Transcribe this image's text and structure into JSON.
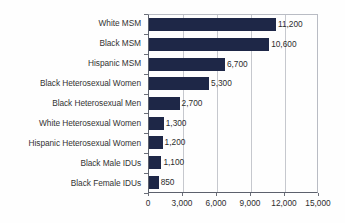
{
  "chart_data": {
    "type": "bar",
    "orientation": "horizontal",
    "title": "",
    "subtitle": "",
    "xlabel": "",
    "ylabel": "",
    "xlim": [
      0,
      15000
    ],
    "grid": true,
    "legend": false,
    "legend_position": "none",
    "bar_color": "#1e2747",
    "gridline_color": "#c6c8ce",
    "axis_color": "#5d616d",
    "background_color": "#fefefe",
    "categories": [
      "White MSM",
      "Black MSM",
      "Hispanic MSM",
      "Black Heterosexual Women",
      "Black Heterosexual Men",
      "White Heterosexual Women",
      "Hispanic Heterosexual Women",
      "Black Male IDUs",
      "Black Female IDUs"
    ],
    "values": [
      11200,
      10600,
      6700,
      5300,
      2700,
      1300,
      1200,
      1100,
      850
    ],
    "value_labels": [
      "11,200",
      "10,600",
      "6,700",
      "5,300",
      "2,700",
      "1,300",
      "1,200",
      "1,100",
      "850"
    ],
    "xticks": [
      0,
      3000,
      6000,
      9000,
      12000,
      15000
    ],
    "xtick_labels": [
      "0",
      "3,000",
      "6,000",
      "9,000",
      "12,000",
      "15,000"
    ]
  }
}
